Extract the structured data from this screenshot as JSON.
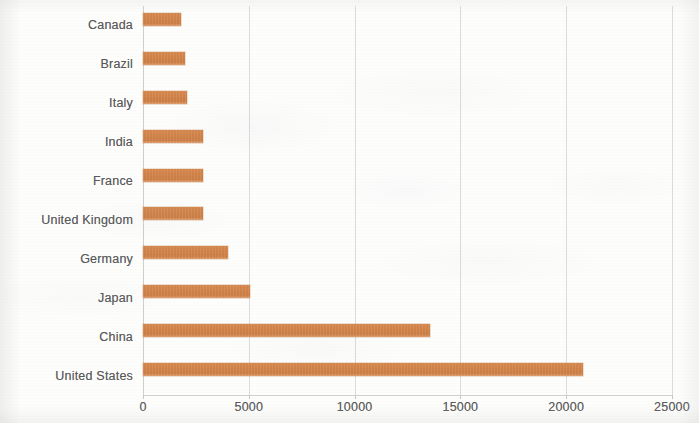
{
  "chart_data": {
    "type": "bar",
    "orientation": "horizontal",
    "title": "",
    "subtitle": "",
    "xlabel": "",
    "ylabel": "",
    "categories": [
      "Canada",
      "Brazil",
      "Italy",
      "India",
      "France",
      "United Kingdom",
      "Germany",
      "Japan",
      "China",
      "United States"
    ],
    "values": [
      1800,
      1980,
      2080,
      2840,
      2840,
      2840,
      4020,
      5060,
      13560,
      20790
    ],
    "xlim": [
      0,
      25000
    ],
    "xticks": [
      0,
      5000,
      10000,
      15000,
      20000,
      25000
    ],
    "xticklabels": [
      "0",
      "5000",
      "10000",
      "15000",
      "20000",
      "25000"
    ],
    "grid": true,
    "grid_axis": "x",
    "legend": false,
    "legend_position": "none",
    "series": [
      {
        "name": "",
        "values": [
          1800,
          1980,
          2080,
          2840,
          2840,
          2840,
          4020,
          5060,
          13560,
          20790
        ]
      }
    ],
    "colors": {
      "bar": "#d3854b",
      "bar_highlight": "#e2a070",
      "text": "#5b5b5b",
      "gridline": "#d7d9d7",
      "axis": "#d2d4d2",
      "background": "#fdfdfc"
    }
  }
}
